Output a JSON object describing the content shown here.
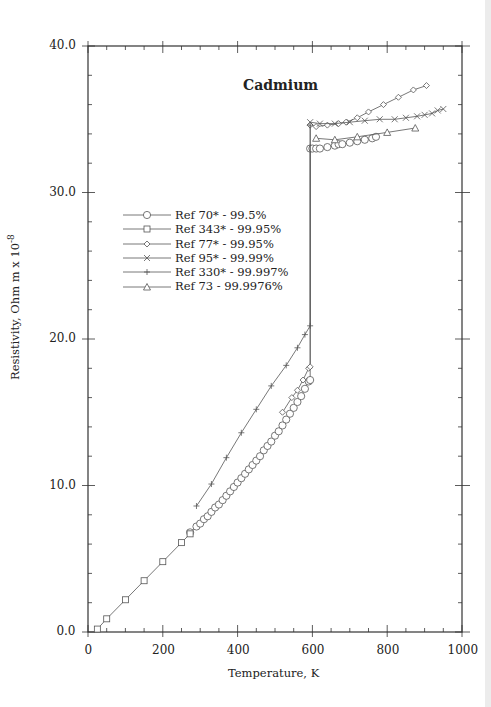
{
  "chart_data": {
    "type": "line",
    "title": "Cadmium",
    "xlabel": "Temperature,  K",
    "ylabel": "Resistivity, Ohm m x 10",
    "ylabel_exponent": "-8",
    "xlim": [
      0,
      1000
    ],
    "ylim": [
      0.0,
      40.0
    ],
    "xticks": [
      "0",
      "200",
      "400",
      "600",
      "800",
      "1000"
    ],
    "yticks": [
      "0.0",
      "10.0",
      "20.0",
      "30.0",
      "40.0"
    ],
    "grid": false,
    "legend_position": "upper-left (inside)",
    "series": [
      {
        "name": "Ref 70* - 99.5%",
        "marker": "circle",
        "points": [
          [
            273,
            6.8
          ],
          [
            290,
            7.2
          ],
          [
            300,
            7.4
          ],
          [
            310,
            7.7
          ],
          [
            320,
            7.9
          ],
          [
            330,
            8.2
          ],
          [
            340,
            8.5
          ],
          [
            350,
            8.7
          ],
          [
            360,
            9.0
          ],
          [
            370,
            9.3
          ],
          [
            380,
            9.6
          ],
          [
            390,
            9.9
          ],
          [
            400,
            10.2
          ],
          [
            410,
            10.5
          ],
          [
            420,
            10.8
          ],
          [
            430,
            11.1
          ],
          [
            440,
            11.4
          ],
          [
            450,
            11.7
          ],
          [
            460,
            12.0
          ],
          [
            470,
            12.4
          ],
          [
            480,
            12.7
          ],
          [
            490,
            13.0
          ],
          [
            500,
            13.4
          ],
          [
            510,
            13.7
          ],
          [
            520,
            14.1
          ],
          [
            530,
            14.5
          ],
          [
            540,
            14.9
          ],
          [
            550,
            15.3
          ],
          [
            560,
            15.7
          ],
          [
            570,
            16.1
          ],
          [
            580,
            16.6
          ],
          [
            590,
            17.1
          ],
          [
            594,
            17.2
          ],
          [
            594,
            33.0
          ],
          [
            600,
            33.0
          ],
          [
            610,
            33.0
          ],
          [
            620,
            33.0
          ],
          [
            640,
            33.1
          ],
          [
            660,
            33.2
          ],
          [
            670,
            33.3
          ],
          [
            680,
            33.3
          ],
          [
            700,
            33.4
          ],
          [
            720,
            33.5
          ],
          [
            740,
            33.6
          ],
          [
            760,
            33.7
          ],
          [
            770,
            33.8
          ]
        ]
      },
      {
        "name": "Ref 343* - 99.95%",
        "marker": "square",
        "points": [
          [
            25,
            0.2
          ],
          [
            50,
            0.9
          ],
          [
            100,
            2.2
          ],
          [
            150,
            3.5
          ],
          [
            200,
            4.8
          ],
          [
            250,
            6.1
          ],
          [
            273,
            6.7
          ]
        ]
      },
      {
        "name": "Ref 77* - 99.95%",
        "marker": "diamond",
        "points": [
          [
            520,
            15.0
          ],
          [
            545,
            16.0
          ],
          [
            560,
            16.5
          ],
          [
            575,
            17.2
          ],
          [
            590,
            18.0
          ],
          [
            594,
            18.1
          ],
          [
            594,
            34.6
          ],
          [
            610,
            34.5
          ],
          [
            640,
            34.6
          ],
          [
            670,
            34.7
          ],
          [
            690,
            34.8
          ],
          [
            720,
            35.1
          ],
          [
            750,
            35.5
          ],
          [
            790,
            36.0
          ],
          [
            830,
            36.5
          ],
          [
            870,
            37.0
          ],
          [
            905,
            37.3
          ]
        ]
      },
      {
        "name": "Ref 95* - 99.99%",
        "marker": "x",
        "points": [
          [
            594,
            34.8
          ],
          [
            620,
            34.7
          ],
          [
            660,
            34.7
          ],
          [
            700,
            34.8
          ],
          [
            740,
            34.9
          ],
          [
            780,
            35.0
          ],
          [
            820,
            35.0
          ],
          [
            850,
            35.1
          ],
          [
            880,
            35.2
          ],
          [
            900,
            35.3
          ],
          [
            920,
            35.4
          ],
          [
            935,
            35.6
          ],
          [
            950,
            35.7
          ]
        ]
      },
      {
        "name": "Ref 330* - 99.997%",
        "marker": "plus",
        "points": [
          [
            290,
            8.6
          ],
          [
            330,
            10.1
          ],
          [
            370,
            11.9
          ],
          [
            410,
            13.6
          ],
          [
            450,
            15.2
          ],
          [
            490,
            16.8
          ],
          [
            530,
            18.2
          ],
          [
            560,
            19.4
          ],
          [
            580,
            20.3
          ],
          [
            594,
            20.9
          ],
          [
            594,
            34.6
          ]
        ]
      },
      {
        "name": "Ref 73 - 99.9976%",
        "marker": "triangle",
        "points": [
          [
            610,
            33.7
          ],
          [
            660,
            33.6
          ],
          [
            720,
            33.8
          ],
          [
            800,
            34.1
          ],
          [
            875,
            34.4
          ]
        ]
      }
    ]
  },
  "axes": {
    "x_ticks": [
      "0",
      "200",
      "400",
      "600",
      "800",
      "1000"
    ],
    "y_ticks": [
      "0.0",
      "10.0",
      "20.0",
      "30.0",
      "40.0"
    ],
    "xlabel": "Temperature,  K",
    "ylabel": "Resistivity, Ohm m x 10",
    "ylabel_exp": "-8"
  },
  "title": "Cadmium",
  "legend": [
    {
      "label": "Ref 70* - 99.5%",
      "marker": "circle"
    },
    {
      "label": "Ref 343* - 99.95%",
      "marker": "square"
    },
    {
      "label": "Ref 77* - 99.95%",
      "marker": "diamond"
    },
    {
      "label": "Ref 95* - 99.99%",
      "marker": "x"
    },
    {
      "label": "Ref 330* - 99.997%",
      "marker": "plus"
    },
    {
      "label": "Ref 73 - 99.9976%",
      "marker": "triangle"
    }
  ],
  "colors": {
    "line": "#555555",
    "axis": "#333333",
    "text": "#222222"
  }
}
